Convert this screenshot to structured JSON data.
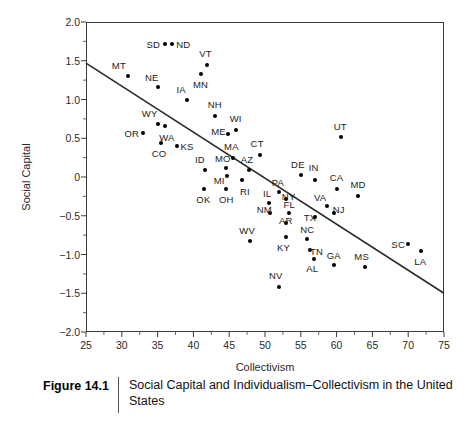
{
  "figure": {
    "number": "Figure 14.1",
    "caption": "Social Capital and Individualism–Collectivism in the United States"
  },
  "chart_data": {
    "type": "scatter",
    "title": "Social Capital and Individualism–Collectivism in the United States",
    "xlabel": "Collectivism",
    "ylabel": "Social Capital",
    "xlim": [
      25,
      75
    ],
    "ylim": [
      -2.0,
      2.0
    ],
    "xticks": [
      "25",
      "30",
      "35",
      "40",
      "45",
      "50",
      "55",
      "60",
      "65",
      "70",
      "75"
    ],
    "yticks": [
      "2.0",
      "1.5",
      "1.0",
      "0.5",
      "0",
      "-0.5",
      "-1.0",
      "-1.5",
      "-2.0"
    ],
    "grid": false,
    "legend": null,
    "point_color": "#000000",
    "trendline": {
      "x0": 25,
      "y0": 1.47,
      "x1": 75,
      "y1": -1.5,
      "color": "#2b2b2b"
    },
    "points": [
      {
        "label": "MT",
        "x": 30.8,
        "y": 1.3,
        "lx": 29.6,
        "ly": 1.45
      },
      {
        "label": "SD",
        "x": 36.1,
        "y": 1.72,
        "lx": 34.4,
        "ly": 1.72
      },
      {
        "label": "ND",
        "x": 37.0,
        "y": 1.72,
        "lx": 38.6,
        "ly": 1.72
      },
      {
        "label": "NE",
        "x": 35.0,
        "y": 1.16,
        "lx": 34.2,
        "ly": 1.29
      },
      {
        "label": "VT",
        "x": 41.9,
        "y": 1.44,
        "lx": 41.7,
        "ly": 1.6
      },
      {
        "label": "MN",
        "x": 41.0,
        "y": 1.33,
        "lx": 41.0,
        "ly": 1.2
      },
      {
        "label": "IA",
        "x": 39.1,
        "y": 1.0,
        "lx": 38.3,
        "ly": 1.13
      },
      {
        "label": "NH",
        "x": 43.0,
        "y": 0.79,
        "lx": 43.0,
        "ly": 0.94
      },
      {
        "label": "WY",
        "x": 35.0,
        "y": 0.68,
        "lx": 33.9,
        "ly": 0.82
      },
      {
        "label": "OR",
        "x": 32.9,
        "y": 0.57,
        "lx": 31.4,
        "ly": 0.57
      },
      {
        "label": "WA",
        "x": 36.1,
        "y": 0.66,
        "lx": 36.3,
        "ly": 0.52
      },
      {
        "label": "WI",
        "x": 45.9,
        "y": 0.61,
        "lx": 45.9,
        "ly": 0.76
      },
      {
        "label": "ME",
        "x": 44.9,
        "y": 0.55,
        "lx": 43.5,
        "ly": 0.59
      },
      {
        "label": "CO",
        "x": 35.5,
        "y": 0.44,
        "lx": 35.2,
        "ly": 0.31
      },
      {
        "label": "KS",
        "x": 37.7,
        "y": 0.4,
        "lx": 39.1,
        "ly": 0.4
      },
      {
        "label": "UT",
        "x": 60.6,
        "y": 0.51,
        "lx": 60.5,
        "ly": 0.66
      },
      {
        "label": "MA",
        "x": 45.5,
        "y": 0.25,
        "lx": 45.3,
        "ly": 0.4
      },
      {
        "label": "CT",
        "x": 49.3,
        "y": 0.29,
        "lx": 48.9,
        "ly": 0.44
      },
      {
        "label": "AZ",
        "x": 47.7,
        "y": 0.09,
        "lx": 47.5,
        "ly": 0.23
      },
      {
        "label": "ID",
        "x": 41.6,
        "y": 0.09,
        "lx": 40.9,
        "ly": 0.23
      },
      {
        "label": "MO",
        "x": 44.6,
        "y": 0.11,
        "lx": 44.1,
        "ly": 0.24
      },
      {
        "label": "DE",
        "x": 55.0,
        "y": 0.02,
        "lx": 54.6,
        "ly": 0.17
      },
      {
        "label": "IN",
        "x": 57.0,
        "y": -0.04,
        "lx": 56.8,
        "ly": 0.13
      },
      {
        "label": "MI",
        "x": 44.7,
        "y": 0.01,
        "lx": 43.6,
        "ly": -0.04
      },
      {
        "label": "RI",
        "x": 46.8,
        "y": -0.04,
        "lx": 47.2,
        "ly": -0.18
      },
      {
        "label": "PA",
        "x": 52.0,
        "y": -0.19,
        "lx": 51.8,
        "ly": -0.07
      },
      {
        "label": "CA",
        "x": 60.0,
        "y": -0.15,
        "lx": 60.0,
        "ly": 0.0
      },
      {
        "label": "MD",
        "x": 63.0,
        "y": -0.24,
        "lx": 63.0,
        "ly": -0.09
      },
      {
        "label": "OK",
        "x": 41.5,
        "y": -0.15,
        "lx": 41.4,
        "ly": -0.29
      },
      {
        "label": "OH",
        "x": 44.5,
        "y": -0.16,
        "lx": 44.6,
        "ly": -0.29
      },
      {
        "label": "IL",
        "x": 50.6,
        "y": -0.34,
        "lx": 50.3,
        "ly": -0.21
      },
      {
        "label": "NY",
        "x": 53.0,
        "y": -0.29,
        "lx": 53.3,
        "ly": -0.25
      },
      {
        "label": "VA",
        "x": 58.6,
        "y": -0.38,
        "lx": 57.7,
        "ly": -0.26
      },
      {
        "label": "NJ",
        "x": 59.6,
        "y": -0.47,
        "lx": 60.3,
        "ly": -0.41
      },
      {
        "label": "FL",
        "x": 53.3,
        "y": -0.47,
        "lx": 53.4,
        "ly": -0.35
      },
      {
        "label": "NM",
        "x": 50.7,
        "y": -0.47,
        "lx": 49.9,
        "ly": -0.41
      },
      {
        "label": "AR",
        "x": 53.0,
        "y": -0.59,
        "lx": 52.9,
        "ly": -0.56
      },
      {
        "label": "TX",
        "x": 57.0,
        "y": -0.52,
        "lx": 56.3,
        "ly": -0.51
      },
      {
        "label": "WV",
        "x": 47.9,
        "y": -0.82,
        "lx": 47.5,
        "ly": -0.69
      },
      {
        "label": "KY",
        "x": 53.0,
        "y": -0.77,
        "lx": 52.6,
        "ly": -0.9
      },
      {
        "label": "NC",
        "x": 55.9,
        "y": -0.8,
        "lx": 55.9,
        "ly": -0.67
      },
      {
        "label": "TN",
        "x": 56.3,
        "y": -0.94,
        "lx": 57.2,
        "ly": -0.96
      },
      {
        "label": "AL",
        "x": 56.9,
        "y": -1.06,
        "lx": 56.6,
        "ly": -1.18
      },
      {
        "label": "GA",
        "x": 59.7,
        "y": -1.13,
        "lx": 59.6,
        "ly": -1.0
      },
      {
        "label": "MS",
        "x": 63.9,
        "y": -1.16,
        "lx": 63.5,
        "ly": -1.02
      },
      {
        "label": "SC",
        "x": 70.0,
        "y": -0.86,
        "lx": 68.6,
        "ly": -0.86
      },
      {
        "label": "LA",
        "x": 71.8,
        "y": -0.95,
        "lx": 71.7,
        "ly": -1.09
      },
      {
        "label": "NV",
        "x": 51.9,
        "y": -1.42,
        "lx": 51.5,
        "ly": -1.27
      }
    ]
  }
}
